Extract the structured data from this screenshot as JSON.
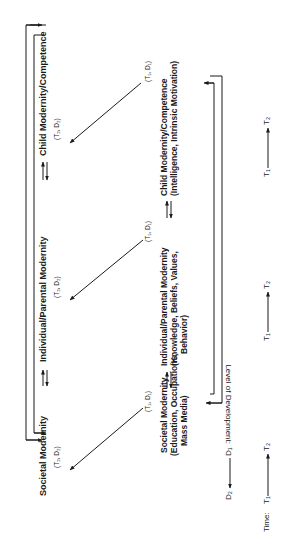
{
  "diagram": {
    "orientation": "rotated -90deg (landscape figure printed sideways)",
    "time_2_row": {
      "nodes": [
        {
          "title": "Societal Modernity",
          "coord": "(T₂, D₂)"
        },
        {
          "title": "Individual/Parental Modernity",
          "coord": "(T₂, D₂)"
        },
        {
          "title": "Child Modernity/Competence",
          "coord": "(T₂, D₂)"
        }
      ]
    },
    "time_1_row": {
      "nodes": [
        {
          "coord": "(T₁, D₁)",
          "title": "Societal Modernity",
          "desc_lines": [
            "(Education, Occupations,",
            "Mass Media)"
          ]
        },
        {
          "coord": "(T₁, D₁)",
          "title": "Individual/Parental Modernity",
          "desc_lines": [
            "(Knowledge, Beliefs, Values,",
            "Behavior)"
          ]
        },
        {
          "coord": "(T₁, D₁)",
          "title": "Child Modernity/Competence",
          "desc_lines": [
            "(Intelligence, Intrinsic Motivation)"
          ]
        }
      ]
    },
    "axes": {
      "level_label": "Level of Development:",
      "level_from": "D₁",
      "level_to": "D₂",
      "time_label": "Time:",
      "time_from": "T₁",
      "time_to": "T₂"
    },
    "edges": [
      {
        "from": "Societal Modernity (T1,D1)",
        "to": "Societal Modernity (T2,D2)",
        "type": "arrow"
      },
      {
        "from": "Individual/Parental Modernity (T1,D1)",
        "to": "Individual/Parental Modernity (T2,D2)",
        "type": "arrow"
      },
      {
        "from": "Child Modernity/Competence (T1,D1)",
        "to": "Child Modernity/Competence (T2,D2)",
        "type": "arrow"
      },
      {
        "between": [
          "Societal Modernity",
          "Individual/Parental Modernity"
        ],
        "type": "bidirectional",
        "row": "T1"
      },
      {
        "between": [
          "Individual/Parental Modernity",
          "Child Modernity/Competence"
        ],
        "type": "bidirectional",
        "row": "T1"
      },
      {
        "between": [
          "Societal Modernity",
          "Individual/Parental Modernity"
        ],
        "type": "bidirectional",
        "row": "T2"
      },
      {
        "between": [
          "Individual/Parental Modernity",
          "Child Modernity/Competence"
        ],
        "type": "bidirectional",
        "row": "T2"
      },
      {
        "between": [
          "Societal Modernity",
          "Child Modernity/Competence"
        ],
        "type": "bracket-bidirectional",
        "row": "T2"
      },
      {
        "between": [
          "Societal Modernity",
          "Child Modernity/Competence"
        ],
        "type": "bracket-bidirectional",
        "row": "T1"
      }
    ]
  }
}
